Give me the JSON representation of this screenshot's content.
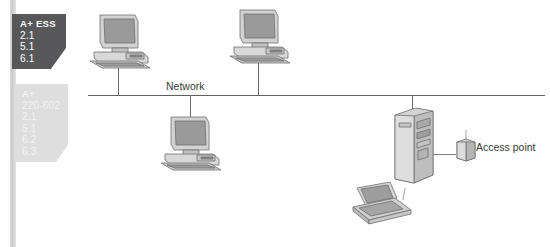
{
  "diagram": {
    "background_color": "#ffffff",
    "line_color": "#5f5f5f"
  },
  "objective_tabs": [
    {
      "id": "a-plus-ess",
      "state": "active",
      "background_color": "#58585a",
      "text_color": "#ffffff",
      "title": "A+ ESS",
      "objectives": [
        "2.1",
        "5.1",
        "6.1"
      ]
    },
    {
      "id": "a-plus-220-602",
      "state": "inactive",
      "background_color": "#dedede",
      "text_color": "#f3f3f3",
      "title": "A+",
      "objectives": [
        "220-602",
        "2.1",
        "5.1",
        "6.2",
        "6.3"
      ]
    }
  ],
  "labels": {
    "network": "Network",
    "access_point": "Access point"
  },
  "nodes": [
    {
      "id": "workstation-1",
      "type": "desktop-computer",
      "position": "top-left",
      "connected_to": "network-backbone"
    },
    {
      "id": "workstation-2",
      "type": "desktop-computer",
      "position": "top-center",
      "connected_to": "network-backbone"
    },
    {
      "id": "workstation-3",
      "type": "desktop-computer",
      "position": "below-center",
      "connected_to": "network-backbone"
    },
    {
      "id": "server-tower",
      "type": "tower-server",
      "position": "right",
      "connected_to": "network-backbone"
    },
    {
      "id": "access-point",
      "type": "wireless-access-point",
      "position": "right",
      "connected_to": "server-tower"
    },
    {
      "id": "laptop",
      "type": "wireless-laptop",
      "position": "bottom-right",
      "connected_to": "access-point"
    }
  ]
}
